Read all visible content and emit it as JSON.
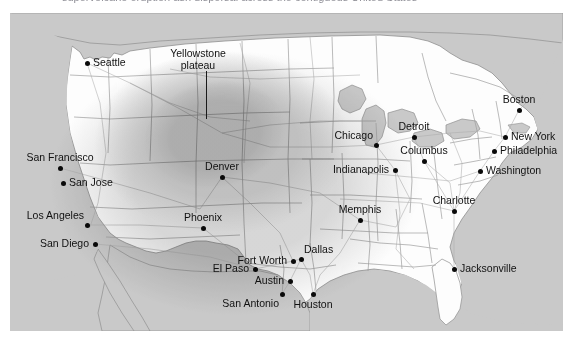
{
  "figure": {
    "kind": "map",
    "clipped_header_text": "supervolcano eruption ash dispersal across the contiguous United States",
    "background_color": "#ffffff",
    "map_frame": {
      "x": 10,
      "y": 13,
      "width": 553,
      "height": 318
    }
  },
  "legend_colors": {
    "ocean": "#c9c9c9",
    "land": "#fdfdfd",
    "border_line": "#9a9a9a",
    "ash_outer": "#d8d8d8",
    "ash_middle": "#b9b9b9",
    "ash_inner": "#a3a3a3",
    "city_dot": "#0a0a0a",
    "label_text": "#111111"
  },
  "annotation": {
    "line1": "Yellowstone",
    "line2": "plateau",
    "leader_line": true
  },
  "ash_zones": [
    {
      "name": "outer-ashfall-zone",
      "intensity": "light",
      "fill": "#d8d8d8"
    },
    {
      "name": "middle-ashfall-zone",
      "intensity": "moderate",
      "fill": "#bdbdbd"
    },
    {
      "name": "inner-ashfall-zone",
      "intensity": "heavy",
      "fill": "#a6a6a6"
    }
  ],
  "cities": [
    {
      "name": "Seattle",
      "x": 77,
      "y": 50,
      "label_pos": "lab-r"
    },
    {
      "name": "San Francisco",
      "x": 50,
      "y": 155,
      "label_pos": "lab-t"
    },
    {
      "name": "San Jose",
      "x": 53,
      "y": 170,
      "label_pos": "lab-r"
    },
    {
      "name": "Los Angeles",
      "x": 77,
      "y": 212,
      "label_pos": "lab-tl"
    },
    {
      "name": "San Diego",
      "x": 85,
      "y": 231,
      "label_pos": "lab-l"
    },
    {
      "name": "Denver",
      "x": 212,
      "y": 164,
      "label_pos": "lab-t"
    },
    {
      "name": "Phoenix",
      "x": 193,
      "y": 215,
      "label_pos": "lab-t"
    },
    {
      "name": "El Paso",
      "x": 245,
      "y": 256,
      "label_pos": "lab-l"
    },
    {
      "name": "Fort Worth",
      "x": 283,
      "y": 248,
      "label_pos": "lab-l"
    },
    {
      "name": "Dallas",
      "x": 291,
      "y": 246,
      "label_pos": "lab-tr"
    },
    {
      "name": "Austin",
      "x": 280,
      "y": 268,
      "label_pos": "lab-l"
    },
    {
      "name": "San Antonio",
      "x": 272,
      "y": 281,
      "label_pos": "lab-bl"
    },
    {
      "name": "Houston",
      "x": 303,
      "y": 281,
      "label_pos": "lab-b"
    },
    {
      "name": "Chicago",
      "x": 366,
      "y": 132,
      "label_pos": "lab-tl"
    },
    {
      "name": "Detroit",
      "x": 404,
      "y": 124,
      "label_pos": "lab-t"
    },
    {
      "name": "Columbus",
      "x": 414,
      "y": 148,
      "label_pos": "lab-t"
    },
    {
      "name": "Indianapolis",
      "x": 385,
      "y": 157,
      "label_pos": "lab-l"
    },
    {
      "name": "Memphis",
      "x": 350,
      "y": 207,
      "label_pos": "lab-t"
    },
    {
      "name": "Charlotte",
      "x": 444,
      "y": 198,
      "label_pos": "lab-t"
    },
    {
      "name": "Jacksonville",
      "x": 444,
      "y": 256,
      "label_pos": "lab-r"
    },
    {
      "name": "Boston",
      "x": 509,
      "y": 97,
      "label_pos": "lab-t"
    },
    {
      "name": "New York",
      "x": 495,
      "y": 124,
      "label_pos": "lab-r"
    },
    {
      "name": "Philadelphia",
      "x": 484,
      "y": 138,
      "label_pos": "lab-r"
    },
    {
      "name": "Washington",
      "x": 470,
      "y": 158,
      "label_pos": "lab-r"
    }
  ]
}
